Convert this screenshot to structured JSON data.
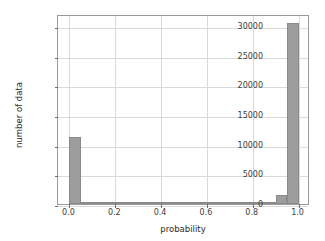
{
  "chart_data": {
    "type": "bar",
    "title": "",
    "subtitle": "",
    "xlabel": "probability",
    "ylabel": "number of data",
    "xlim": [
      -0.05,
      1.05
    ],
    "ylim": [
      0,
      32000
    ],
    "grid": true,
    "legend": null,
    "bin_width": 0.05,
    "bar_color": "#9d9d9d",
    "bar_edge_color": "#8a8a8a",
    "grid_color": "#d9d9d9",
    "axis_color": "#9a9a9a",
    "text_color": "#3d3d3d",
    "xticks": [
      "0.0",
      "0.2",
      "0.4",
      "0.6",
      "0.8",
      "1.0"
    ],
    "xtick_values": [
      0.0,
      0.2,
      0.4,
      0.6,
      0.8,
      1.0
    ],
    "yticks": [
      "0",
      "5000",
      "10000",
      "15000",
      "20000",
      "25000",
      "30000"
    ],
    "ytick_values": [
      0,
      5000,
      10000,
      15000,
      20000,
      25000,
      30000
    ],
    "bins": [
      {
        "x0": 0.0,
        "x1": 0.05,
        "value": 11350
      },
      {
        "x0": 0.05,
        "x1": 0.1,
        "value": 150
      },
      {
        "x0": 0.1,
        "x1": 0.15,
        "value": 60
      },
      {
        "x0": 0.15,
        "x1": 0.2,
        "value": 40
      },
      {
        "x0": 0.2,
        "x1": 0.25,
        "value": 30
      },
      {
        "x0": 0.25,
        "x1": 0.3,
        "value": 30
      },
      {
        "x0": 0.3,
        "x1": 0.35,
        "value": 25
      },
      {
        "x0": 0.35,
        "x1": 0.4,
        "value": 25
      },
      {
        "x0": 0.4,
        "x1": 0.45,
        "value": 25
      },
      {
        "x0": 0.45,
        "x1": 0.5,
        "value": 25
      },
      {
        "x0": 0.5,
        "x1": 0.55,
        "value": 25
      },
      {
        "x0": 0.55,
        "x1": 0.6,
        "value": 25
      },
      {
        "x0": 0.6,
        "x1": 0.65,
        "value": 30
      },
      {
        "x0": 0.65,
        "x1": 0.7,
        "value": 30
      },
      {
        "x0": 0.7,
        "x1": 0.75,
        "value": 40
      },
      {
        "x0": 0.75,
        "x1": 0.8,
        "value": 55
      },
      {
        "x0": 0.8,
        "x1": 0.85,
        "value": 90
      },
      {
        "x0": 0.85,
        "x1": 0.9,
        "value": 300
      },
      {
        "x0": 0.9,
        "x1": 0.95,
        "value": 1500
      },
      {
        "x0": 0.95,
        "x1": 1.0,
        "value": 30550
      }
    ],
    "categories": [
      "0.00",
      "0.05",
      "0.10",
      "0.15",
      "0.20",
      "0.25",
      "0.30",
      "0.35",
      "0.40",
      "0.45",
      "0.50",
      "0.55",
      "0.60",
      "0.65",
      "0.70",
      "0.75",
      "0.80",
      "0.85",
      "0.90",
      "0.95"
    ],
    "values": [
      11350,
      150,
      60,
      40,
      30,
      30,
      25,
      25,
      25,
      25,
      25,
      25,
      30,
      30,
      40,
      55,
      90,
      300,
      1500,
      30550
    ]
  }
}
